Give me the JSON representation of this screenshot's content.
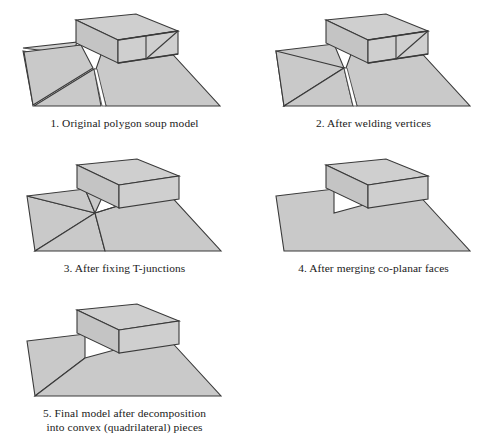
{
  "page": {
    "background_color": "#ffffff",
    "fill_color": "#c9c9c9",
    "fill_color_light": "#d4d4d4",
    "stroke_color": "#3a3a3a",
    "text_color": "#1a1a1a"
  },
  "figures": [
    {
      "index": "1",
      "caption": "1. Original polygon soup model",
      "description": "Ground plane made of loose overlapping triangles with visible cracks and gaps, plus a box whose front face is split by T-junction edges"
    },
    {
      "index": "2",
      "caption": "2. After welding vertices",
      "description": "Cracks closed along most seams, one sliver gap remains near the box front-left corner"
    },
    {
      "index": "3",
      "caption": "3. After fixing T-junctions",
      "description": "All ground triangles fan out from a single shared interior vertex, no gaps remain"
    },
    {
      "index": "4",
      "caption": "4. After merging co-planar faces",
      "description": "Ground is a single quadrilateral and the box faces are unsplit"
    },
    {
      "index": "5",
      "caption": "5. Final model after decomposition\ninto convex (quadrilateral) pieces",
      "description": "Ground split by one diagonal into two convex quadrilateral pieces"
    }
  ]
}
